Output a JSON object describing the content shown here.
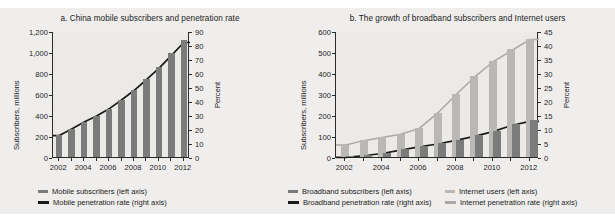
{
  "colors": {
    "background": "#efeeec",
    "plot_background": "#eceae7",
    "bar_dark": "#7b7b7b",
    "bar_light": "#b9b8b4",
    "line_black": "#1a1a1a",
    "line_gray": "#a9a8a4",
    "axis": "#2a2a2a",
    "text": "#1c1c1c"
  },
  "chart_data": [
    {
      "id": "chart-a",
      "type": "bar",
      "title": "a. China mobile subscribers and penetration rate",
      "xlabel": "",
      "ylabel": "Subscribers, millions",
      "y2label": "Percent",
      "grid": false,
      "legend_position": "bottom",
      "categories": [
        "2002",
        "2003",
        "2004",
        "2005",
        "2006",
        "2007",
        "2008",
        "2009",
        "2010",
        "2011",
        "2012"
      ],
      "xticklabels": [
        "2002",
        "2004",
        "2006",
        "2008",
        "2010",
        "2012"
      ],
      "ylim": [
        0,
        1200
      ],
      "yticks": [
        0,
        200,
        400,
        600,
        800,
        1000,
        1200
      ],
      "yticklabels": [
        "0",
        "200",
        "400",
        "600",
        "800",
        "1,000",
        "1,200"
      ],
      "y2lim": [
        0,
        90
      ],
      "y2ticks": [
        0,
        10,
        20,
        30,
        40,
        50,
        60,
        70,
        80,
        90
      ],
      "y2ticklabels": [
        "0",
        "10",
        "20",
        "30",
        "40",
        "50",
        "60",
        "70",
        "80",
        "90"
      ],
      "series": [
        {
          "name": "Mobile subscribers (left axis)",
          "kind": "bar",
          "axis": "left",
          "color": "#7b7b7b",
          "values": [
            207,
            269,
            335,
            393,
            461,
            547,
            641,
            747,
            859,
            986,
            1112
          ]
        },
        {
          "name": "Mobile penetration rate (right axis)",
          "kind": "line",
          "axis": "right",
          "color": "#1a1a1a",
          "values": [
            16.0,
            20.8,
            25.7,
            30.0,
            35.1,
            41.4,
            48.2,
            55.9,
            64.0,
            73.1,
            82.5
          ]
        }
      ]
    },
    {
      "id": "chart-b",
      "type": "bar",
      "title": "b. The growth of broadband subscribers and Internet users",
      "xlabel": "",
      "ylabel": "Subscribers, millions",
      "y2label": "Percent",
      "grid": false,
      "legend_position": "bottom",
      "categories": [
        "2002",
        "2003",
        "2004",
        "2005",
        "2006",
        "2007",
        "2008",
        "2009",
        "2010",
        "2011",
        "2012"
      ],
      "xticklabels": [
        "2002",
        "2004",
        "2006",
        "2008",
        "2010",
        "2012"
      ],
      "ylim": [
        0,
        600
      ],
      "yticks": [
        0,
        100,
        200,
        300,
        400,
        500,
        600
      ],
      "yticklabels": [
        "0",
        "100",
        "200",
        "300",
        "400",
        "500",
        "600"
      ],
      "y2lim": [
        0,
        45
      ],
      "y2ticks": [
        0,
        5,
        10,
        15,
        20,
        25,
        30,
        35,
        40,
        45
      ],
      "y2ticklabels": [
        "0",
        "5",
        "10",
        "15",
        "20",
        "25",
        "30",
        "35",
        "40",
        "45"
      ],
      "series": [
        {
          "name": "Internet users (left axis)",
          "kind": "bar",
          "axis": "left",
          "color": "#b9b8b4",
          "values": [
            59,
            80,
            94,
            111,
            137,
            210,
            298,
            384,
            457,
            513,
            564
          ]
        },
        {
          "name": "Broadband subscribers (left axis)",
          "kind": "bar",
          "axis": "left",
          "color": "#7b7b7b",
          "values": [
            3,
            10,
            21,
            37,
            52,
            66,
            83,
            103,
            126,
            156,
            175
          ]
        },
        {
          "name": "Internet penetration rate (right axis)",
          "kind": "line",
          "axis": "right",
          "color": "#a9a8a4",
          "values": [
            4.6,
            6.2,
            7.3,
            8.5,
            10.5,
            16.0,
            22.6,
            28.9,
            34.3,
            38.3,
            42.3
          ]
        },
        {
          "name": "Broadband penetration rate (right axis)",
          "kind": "line",
          "axis": "right",
          "color": "#1a1a1a",
          "values": [
            0.2,
            0.8,
            1.6,
            2.8,
            4.0,
            5.0,
            6.3,
            7.7,
            9.4,
            11.6,
            13.1
          ]
        }
      ]
    }
  ],
  "legend_a": [
    {
      "label": "Mobile subscribers (left axis)",
      "marker": "bar",
      "color": "#7b7b7b"
    },
    {
      "label": "Mobile penetration rate (right axis)",
      "marker": "line",
      "color": "#1a1a1a"
    }
  ],
  "legend_b_col1": [
    {
      "label": "Broadband subscribers (left axis)",
      "marker": "bar",
      "color": "#7b7b7b"
    },
    {
      "label": "Broadband penetration rate (right axis)",
      "marker": "line",
      "color": "#1a1a1a"
    }
  ],
  "legend_b_col2": [
    {
      "label": "Internet users (left axis)",
      "marker": "bar",
      "color": "#b9b8b4"
    },
    {
      "label": "Internet penetration rate (right axis)",
      "marker": "line",
      "color": "#a9a8a4"
    }
  ]
}
